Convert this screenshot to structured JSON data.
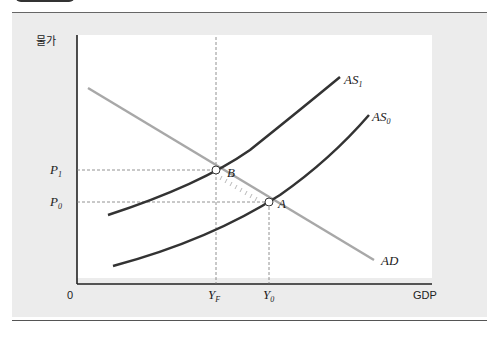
{
  "diagram": {
    "y_axis_label": "물가",
    "x_axis_label": "GDP",
    "origin_label": "0",
    "curves": [
      {
        "name": "AS",
        "subscript": "1",
        "color": "#333333"
      },
      {
        "name": "AS",
        "subscript": "0",
        "color": "#333333"
      },
      {
        "name": "AD",
        "subscript": "",
        "color": "#a8a8a8"
      }
    ],
    "points": [
      {
        "label": "A"
      },
      {
        "label": "B"
      }
    ],
    "price_levels": [
      {
        "name": "P",
        "subscript": "1"
      },
      {
        "name": "P",
        "subscript": "0"
      }
    ],
    "output_levels": [
      {
        "name": "Y",
        "subscript": "F"
      },
      {
        "name": "Y",
        "subscript": "0"
      }
    ],
    "colors": {
      "panel_bg": "#ececec",
      "plot_bg": "#ffffff",
      "as_curve": "#333333",
      "ad_curve": "#a8a8a8"
    }
  }
}
